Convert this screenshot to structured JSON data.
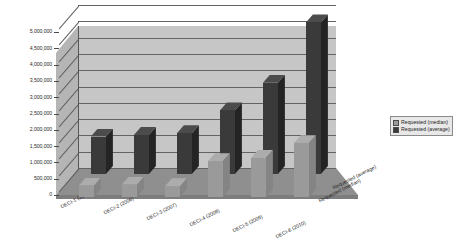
{
  "chart_data": {
    "type": "bar",
    "title": "",
    "subtitle": "",
    "xlabel": "",
    "ylabel": "",
    "zlabel": "",
    "projection": "3d-grouped-depth",
    "grid": true,
    "legend_position": "right",
    "ylim": [
      0,
      5000000
    ],
    "ytick_step": 500000,
    "ytick_labels": [
      "5,000,000",
      "4,500,000",
      "4,000,000",
      "3,500,000",
      "3,000,000",
      "2,500,000",
      "2,000,000",
      "1,500,000",
      "1,000,000",
      "500,000",
      "0"
    ],
    "categories": [
      "DECI-1 (2005)",
      "DECI-2 (2006)",
      "DECI-3 (2007)",
      "DECI-4 (2008)",
      "DECI-5 (2009)",
      "DECI-6 (2010)"
    ],
    "series": [
      {
        "name": "Requested (median)",
        "color": "#9a9a9a",
        "values": [
          350000,
          380000,
          330000,
          1100000,
          1200000,
          1650000
        ]
      },
      {
        "name": "Requested (average)",
        "color": "#3a3a3a",
        "values": [
          1150000,
          1200000,
          1250000,
          1950000,
          2800000,
          4650000
        ]
      }
    ],
    "depth_axis_labels": [
      "Requested (average)",
      "Requested (median)"
    ]
  },
  "legend": {
    "items": [
      {
        "label": "Requested (median)",
        "color": "#9a9a9a"
      },
      {
        "label": "Requested (average)",
        "color": "#3a3a3a"
      }
    ]
  },
  "colors": {
    "wall_back": "#c6c6c6",
    "wall_left": "#b5b5b5",
    "floor": "#8f8f8f",
    "gridline": "#636363",
    "median": "#9a9a9a",
    "average": "#3a3a3a",
    "background": "#ffffff"
  }
}
